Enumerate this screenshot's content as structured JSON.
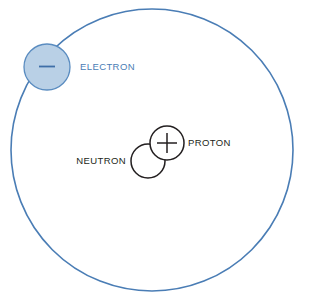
{
  "diagram": {
    "background_color": "#ffffff",
    "orbit": {
      "name": "electron-orbit-path",
      "center_x": 152,
      "center_y": 150,
      "radius": 141,
      "stroke_color": "#4a7db5",
      "stroke_width": 1.6,
      "fill": "none"
    },
    "particles": {
      "electron": {
        "label": "ELECTRON",
        "charge_symbol": "−",
        "center_x": 47,
        "center_y": 67,
        "radius": 23,
        "fill_color": "#b9d0e6",
        "stroke_color": "#5a8cc0",
        "label_color": "#4a7db5",
        "label_x": 80,
        "label_y": 70
      },
      "proton": {
        "label": "PROTON",
        "charge_symbol": "+",
        "center_x": 167,
        "center_y": 143,
        "radius": 17,
        "fill_color": "#ffffff",
        "stroke_color": "#231f20",
        "label_color": "#231f20",
        "label_x": 188,
        "label_y": 146
      },
      "neutron": {
        "label": "NEUTRON",
        "charge_symbol": "",
        "center_x": 148,
        "center_y": 161,
        "radius": 17,
        "fill_color": "#ffffff",
        "stroke_color": "#231f20",
        "label_color": "#231f20",
        "label_x": 126,
        "label_y": 164
      }
    }
  }
}
